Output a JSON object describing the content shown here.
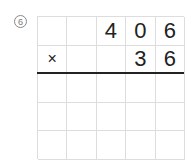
{
  "problem": {
    "number_label": "6",
    "grid": [
      [
        "",
        "",
        "4",
        "0",
        "6"
      ],
      [
        "×",
        "",
        "",
        "3",
        "6"
      ],
      [
        "",
        "",
        "",
        "",
        ""
      ],
      [
        "",
        "",
        "",
        "",
        ""
      ],
      [
        "",
        "",
        "",
        "",
        ""
      ]
    ]
  }
}
